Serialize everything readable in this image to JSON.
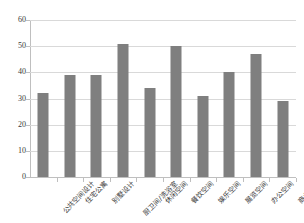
{
  "chart_data": {
    "type": "bar",
    "title": "",
    "xlabel": "",
    "ylabel": "",
    "ylim": [
      0,
      60
    ],
    "ytick_step": 10,
    "grid": true,
    "legend": false,
    "bar_color": "#7f7f7f",
    "categories": [
      "公共空间设计",
      "住宅公寓",
      "别墅设计",
      "厨卫间/洗浴室",
      "休闲空间",
      "餐饮空间",
      "娱乐空间",
      "展览空间",
      "办公空间",
      "商业空间"
    ],
    "values": [
      32,
      39,
      39,
      51,
      34,
      50,
      31,
      40,
      47,
      29
    ],
    "ytick_labels": [
      "0",
      "10",
      "20",
      "30",
      "40",
      "50",
      "60"
    ]
  }
}
